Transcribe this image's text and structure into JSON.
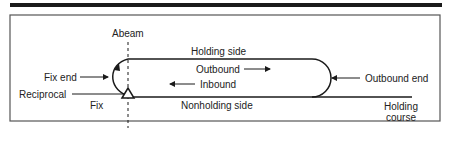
{
  "diagram": {
    "labels": {
      "abeam": "Abeam",
      "holding_side": "Holding side",
      "outbound": "Outbound",
      "inbound": "Inbound",
      "fix_end": "Fix end",
      "outbound_end": "Outbound end",
      "reciprocal": "Reciprocal",
      "fix": "Fix",
      "nonholding_side": "Nonholding side",
      "holding_course_line1": "Holding",
      "holding_course_line2": "course"
    },
    "colors": {
      "stroke": "#1a1a1a",
      "frame": "#555555",
      "text": "#222222"
    }
  }
}
